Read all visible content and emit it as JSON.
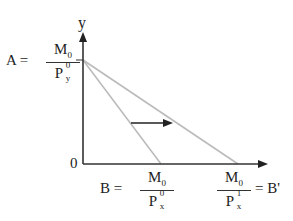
{
  "diagram": {
    "type": "budget-line-shift",
    "axes": {
      "y_label": "y",
      "origin_label": "0",
      "color": "#333333"
    },
    "lines": [
      {
        "name": "original-budget-line",
        "from": "A",
        "to": "B",
        "color": "#bbbbbb"
      },
      {
        "name": "new-budget-line",
        "from": "A",
        "to": "B'",
        "color": "#bbbbbb"
      }
    ],
    "shift_arrow": {
      "direction": "right",
      "color": "#222222"
    },
    "labels": {
      "A": {
        "name": "A",
        "eq": "=",
        "num": "M",
        "num_sub": "0",
        "den": "P",
        "den_sup": "0",
        "den_sub": "y"
      },
      "B": {
        "name": "B",
        "eq": "=",
        "num": "M",
        "num_sub": "0",
        "den": "P",
        "den_sup": "0",
        "den_sub": "x"
      },
      "B_prime": {
        "name": "B'",
        "eq": "=",
        "num": "M",
        "num_sub": "0",
        "den": "P",
        "den_sup": "1",
        "den_sub": "x"
      }
    }
  }
}
